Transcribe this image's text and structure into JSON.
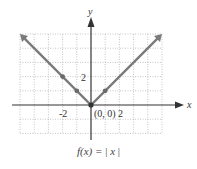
{
  "chart_data": {
    "type": "line",
    "title": "",
    "function_label": "f(x) = |x|",
    "xlabel": "x",
    "ylabel": "y",
    "xlim": [
      -5,
      5
    ],
    "ylim": [
      -2,
      5
    ],
    "grid": true,
    "grid_style": "dotted",
    "x_ticks_labeled": [
      {
        "value": -2,
        "label": "-2"
      },
      {
        "value": 2,
        "label": "2"
      }
    ],
    "y_ticks_labeled": [
      {
        "value": 2,
        "label": "2"
      }
    ],
    "annotations": [
      {
        "x": 0,
        "y": 0,
        "text": "(0, 0)"
      }
    ],
    "series": [
      {
        "name": "f(x) = |x|",
        "x": [
          -5,
          -2,
          -1,
          0,
          1,
          5
        ],
        "y": [
          5,
          2,
          1,
          0,
          1,
          5
        ],
        "marked_points": [
          [
            -2,
            2
          ],
          [
            -1,
            1
          ],
          [
            0,
            0
          ],
          [
            1,
            1
          ]
        ],
        "color": "#7a7a7a",
        "arrows_at_ends": true
      }
    ]
  },
  "labels": {
    "x_axis": "x",
    "y_axis": "y",
    "tick_neg2": "-2",
    "tick_pos2": "2",
    "tick_y2": "2",
    "origin": "(0, 0)"
  },
  "caption": {
    "prefix": "f(x) = ",
    "bar_open": "|",
    "var": "x",
    "bar_close": "|"
  }
}
